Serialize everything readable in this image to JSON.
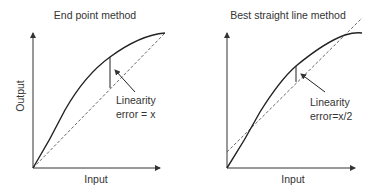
{
  "left": {
    "title": "End point method",
    "ylabel": "Output",
    "xlabel": "Input",
    "annotation_line1": "Linearity",
    "annotation_line2": "error = x"
  },
  "right": {
    "title": "Best straight line method",
    "xlabel": "Input",
    "annotation_line1": "Linearity",
    "annotation_line2": "error=x/2"
  }
}
